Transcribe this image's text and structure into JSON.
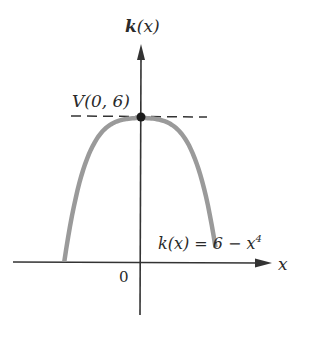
{
  "chart_data": {
    "type": "line",
    "title": "",
    "function_label": "k(x) = 6 − x⁴",
    "xlabel": "x",
    "ylabel": "k(x)",
    "origin_label": "0",
    "vertex": {
      "label": "V(0, 6)",
      "x": 0,
      "y": 6
    },
    "series": [
      {
        "name": "k(x) = 6 − x^4",
        "x": [
          -1.75,
          -1.5,
          -1.25,
          -1,
          -0.75,
          -0.5,
          -0.25,
          0,
          0.25,
          0.5,
          0.75,
          1,
          1.25,
          1.5,
          1.75
        ],
        "values": [
          -3.38,
          0.94,
          3.56,
          5,
          5.68,
          5.94,
          6.0,
          6,
          6.0,
          5.94,
          5.68,
          5,
          3.56,
          0.94,
          -3.38
        ]
      }
    ],
    "annotations": [
      "dashed horizontal line y = 6 through vertex",
      "point marker at vertex V(0, 6)"
    ],
    "grid": false,
    "legend": "none",
    "colors": {
      "curve": "#9a9a9a",
      "axes": "#333333",
      "dash": "#333333",
      "vertex_dot": "#1a1a1a"
    }
  },
  "labels": {
    "y_axis_k": "k",
    "y_axis_paren": "(x)",
    "vertex_text": "V(0, 6)",
    "func_k": "k(x) = 6 − x",
    "func_exp": "4",
    "x_axis": "x",
    "origin": "0"
  }
}
